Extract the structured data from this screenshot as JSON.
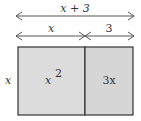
{
  "diagram": {
    "total_width_label": "x + 3",
    "segment_left_label": "x",
    "segment_right_label": "3",
    "height_label": "x",
    "region_left_label": "x",
    "region_left_exponent": "2",
    "region_right_label": "3x",
    "fill_color": "#dcdcdc",
    "stroke_color": "#333333"
  }
}
